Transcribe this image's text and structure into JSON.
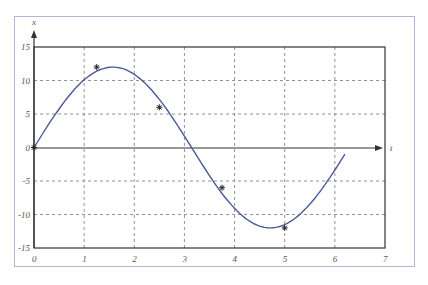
{
  "chart_data": {
    "type": "line",
    "title": "",
    "xlabel": "t",
    "ylabel": "x",
    "xlim": [
      0,
      7
    ],
    "ylim": [
      -15,
      15
    ],
    "grid": true,
    "x_ticks": [
      "0",
      "1",
      "2",
      "3",
      "4",
      "5",
      "6",
      "7"
    ],
    "y_ticks": [
      "15",
      "10",
      "5",
      "0",
      "-5",
      "-10",
      "-15"
    ],
    "series": [
      {
        "name": "curve",
        "style": "line",
        "color": "#4a5a9a",
        "function": "x = 12 sin(t)",
        "x": [
          0,
          0.5,
          1.0,
          1.5,
          2.0,
          2.5,
          3.0,
          3.5,
          4.0,
          4.5,
          5.0,
          5.5,
          6.0,
          6.2
        ],
        "values": [
          0,
          5.75,
          10.1,
          11.97,
          10.91,
          7.18,
          1.69,
          -4.21,
          -9.08,
          -11.73,
          -11.51,
          -8.47,
          -3.35,
          -1.0
        ]
      },
      {
        "name": "samples",
        "style": "marker-asterisk",
        "color": "#333333",
        "x": [
          0,
          1.25,
          2.5,
          3.75,
          5.0
        ],
        "values": [
          0,
          12.0,
          6.0,
          -6.0,
          -12.0
        ]
      }
    ]
  },
  "labels": {
    "x_axis": "t",
    "y_axis": "x",
    "xticks": [
      "0",
      "1",
      "2",
      "3",
      "4",
      "5",
      "6",
      "7"
    ],
    "yticks": [
      "15",
      "10",
      "5",
      "0",
      "-5",
      "-10",
      "-15"
    ]
  }
}
